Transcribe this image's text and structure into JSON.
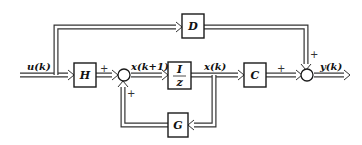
{
  "diagram": {
    "type": "discrete-time state-space block diagram",
    "signals": {
      "input": "u(k)",
      "next_state": "x(k+1)",
      "state": "x(k)",
      "output": "y(k)"
    },
    "blocks": {
      "H": "H",
      "delay_num": "I",
      "delay_den": "z",
      "C": "C",
      "D": "D",
      "G": "G"
    },
    "signs": {
      "sum1_from_H": "+",
      "sum1_from_G": "+",
      "sum2_from_C": "+",
      "sum2_from_D": "+"
    }
  }
}
